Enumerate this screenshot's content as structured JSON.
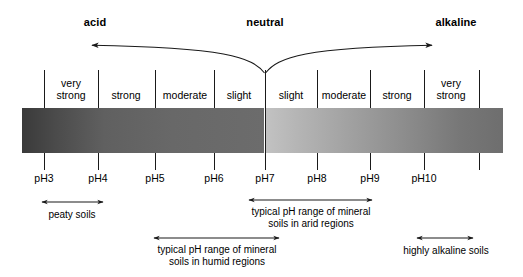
{
  "figure": {
    "header_labels": [
      {
        "text": "acid",
        "x": 95,
        "y": 16
      },
      {
        "text": "neutral",
        "x": 265,
        "y": 16
      },
      {
        "text": "alkaline",
        "x": 456,
        "y": 16
      }
    ],
    "direction_arrows": [
      {
        "name": "acid-direction-arrow",
        "label": "acid"
      },
      {
        "name": "alkaline-direction-arrow",
        "label": "alkaline"
      }
    ],
    "ph_ticks": [
      {
        "label": "pH3",
        "x": 44
      },
      {
        "label": "pH4",
        "x": 98
      },
      {
        "label": "pH5",
        "x": 155
      },
      {
        "label": "pH6",
        "x": 214
      },
      {
        "label": "pH7",
        "x": 265
      },
      {
        "label": "pH8",
        "x": 317
      },
      {
        "label": "pH9",
        "x": 370
      },
      {
        "label": "pH10",
        "x": 424
      },
      {
        "label": "",
        "x": 479
      }
    ],
    "strength_labels": [
      {
        "text": "very\nstrong",
        "x": 71,
        "side": "acid"
      },
      {
        "text": "strong",
        "x": 126,
        "side": "acid"
      },
      {
        "text": "moderate",
        "x": 185,
        "side": "acid"
      },
      {
        "text": "slight",
        "x": 239,
        "side": "acid"
      },
      {
        "text": "slight",
        "x": 291,
        "side": "alkaline"
      },
      {
        "text": "moderate",
        "x": 344,
        "side": "alkaline"
      },
      {
        "text": "strong",
        "x": 397,
        "side": "alkaline"
      },
      {
        "text": "very\nstrong",
        "x": 451,
        "side": "alkaline"
      }
    ],
    "band": {
      "acid_color_start": "#3a3a3a",
      "acid_color_end": "#6c6c6c",
      "alkaline_color_start": "#c2c2c2",
      "alkaline_color_end": "#6e6e6e"
    },
    "annotations": [
      {
        "name": "peaty-soils",
        "caption": "peaty soils",
        "caption_lines": [
          "peaty soils"
        ],
        "x1": 42,
        "x2": 103,
        "y": 202,
        "caption_x": 72,
        "caption_y": 209,
        "ph_range": "pH3-pH4"
      },
      {
        "name": "arid-mineral-soils",
        "caption": "typical pH range of mineral soils in arid regions",
        "caption_lines": [
          "typical pH range of mineral",
          "soils in arid regions"
        ],
        "x1": 249,
        "x2": 372,
        "y": 200,
        "caption_x": 311,
        "caption_y": 206,
        "ph_range": "pH7-pH9"
      },
      {
        "name": "humid-mineral-soils",
        "caption": "typical pH range of mineral soils in humid regions",
        "caption_lines": [
          "typical pH range of mineral",
          "soils in humid regions"
        ],
        "x1": 154,
        "x2": 279,
        "y": 238,
        "caption_x": 217,
        "caption_y": 244,
        "ph_range": "pH5-pH7"
      },
      {
        "name": "highly-alkaline-soils",
        "caption": "highly alkaline soils",
        "caption_lines": [
          "highly alkaline soils"
        ],
        "x1": 417,
        "x2": 473,
        "y": 238,
        "caption_x": 446,
        "caption_y": 245,
        "ph_range": "pH10+"
      }
    ]
  }
}
